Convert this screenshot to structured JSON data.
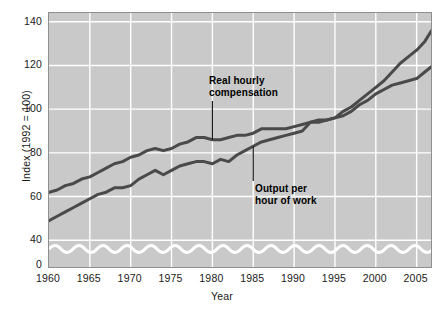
{
  "chart_data": {
    "type": "line",
    "title": "",
    "xlabel": "Year",
    "ylabel": "Index (1992 = 100)",
    "xlim": [
      1960,
      2007
    ],
    "ylim": [
      36,
      144
    ],
    "grid": true,
    "legend_position": "inline-annotations",
    "axis_break": {
      "present": true,
      "style": "wave",
      "between": [
        0,
        40
      ]
    },
    "xticks": [
      1960,
      1965,
      1970,
      1975,
      1980,
      1985,
      1990,
      1995,
      2000,
      2005
    ],
    "xtick_labels": [
      "1960",
      "1965",
      "1970",
      "1975",
      "1980",
      "1985",
      "1990",
      "1995",
      "2000",
      "2005"
    ],
    "yticks": [
      0,
      40,
      60,
      80,
      100,
      120,
      140
    ],
    "ytick_labels": [
      "0",
      "40",
      "60",
      "80",
      "100",
      "120",
      "140"
    ],
    "series": [
      {
        "name": "Real hourly compensation",
        "color": "#4a4a4a",
        "x": [
          1960,
          1961,
          1962,
          1963,
          1964,
          1965,
          1966,
          1967,
          1968,
          1969,
          1970,
          1971,
          1972,
          1973,
          1974,
          1975,
          1976,
          1977,
          1978,
          1979,
          1980,
          1981,
          1982,
          1983,
          1984,
          1985,
          1986,
          1987,
          1988,
          1989,
          1990,
          1991,
          1992,
          1993,
          1994,
          1995,
          1996,
          1997,
          1998,
          1999,
          2000,
          2001,
          2002,
          2003,
          2004,
          2005,
          2006,
          2007
        ],
        "values": [
          62,
          63,
          65,
          66,
          68,
          69,
          71,
          73,
          75,
          76,
          78,
          79,
          81,
          82,
          81,
          82,
          84,
          85,
          87,
          87,
          86,
          86,
          87,
          88,
          88,
          89,
          91,
          91,
          91,
          91,
          92,
          93,
          94,
          95,
          95,
          96,
          97,
          99,
          102,
          104,
          107,
          109,
          111,
          112,
          113,
          114,
          117,
          120
        ]
      },
      {
        "name": "Output per hour of work",
        "color": "#4a4a4a",
        "x": [
          1960,
          1961,
          1962,
          1963,
          1964,
          1965,
          1966,
          1967,
          1968,
          1969,
          1970,
          1971,
          1972,
          1973,
          1974,
          1975,
          1976,
          1977,
          1978,
          1979,
          1980,
          1981,
          1982,
          1983,
          1984,
          1985,
          1986,
          1987,
          1988,
          1989,
          1990,
          1991,
          1992,
          1993,
          1994,
          1995,
          1996,
          1997,
          1998,
          1999,
          2000,
          2001,
          2002,
          2003,
          2004,
          2005,
          2006,
          2007
        ],
        "values": [
          49,
          51,
          53,
          55,
          57,
          59,
          61,
          62,
          64,
          64,
          65,
          68,
          70,
          72,
          70,
          72,
          74,
          75,
          76,
          76,
          75,
          77,
          76,
          79,
          81,
          83,
          85,
          86,
          87,
          88,
          89,
          90,
          94,
          94,
          95,
          96,
          99,
          101,
          104,
          107,
          110,
          113,
          117,
          121,
          124,
          127,
          131,
          137
        ]
      }
    ],
    "annotations": [
      {
        "name": "real-hourly-compensation",
        "text_line1": "Real hourly",
        "text_line2": "compensation",
        "points_to": "Real hourly compensation",
        "leader_year": 1980
      },
      {
        "name": "output-per-hour-of-work",
        "text_line1": "Output per",
        "text_line2": "hour of work",
        "points_to": "Output per hour of work",
        "leader_year": 1985
      }
    ],
    "colors": {
      "plot_background": "#c9c9c9",
      "gridline": "#ffffff",
      "line": "#4a4a4a",
      "axis_break_wave": "#ffffff",
      "border": "#8f8f8f",
      "text": "#1a1a1a"
    }
  }
}
